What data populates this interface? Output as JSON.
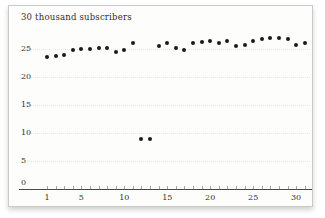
{
  "chart_data": {
    "type": "scatter",
    "title": "30 thousand subscribers",
    "xlabel": "",
    "ylabel": "thousand subscribers",
    "xlim": [
      0,
      32
    ],
    "ylim": [
      0,
      30
    ],
    "grid": "faint dotted horizontal lines",
    "legend": "none",
    "yticks": [
      25,
      20,
      15,
      10,
      5,
      0
    ],
    "ytick_labels": [
      "25",
      "20",
      "15",
      "10",
      "5",
      "0"
    ],
    "xtick_every_unit": true,
    "xticks_labeled": [
      1,
      5,
      10,
      15,
      20,
      25,
      30
    ],
    "xtick_labels": [
      "1",
      "5",
      "10",
      "15",
      "20",
      "25",
      "30"
    ],
    "x": [
      1,
      2,
      3,
      4,
      5,
      6,
      7,
      8,
      9,
      10,
      11,
      12,
      13,
      14,
      15,
      16,
      17,
      18,
      19,
      20,
      21,
      22,
      23,
      24,
      25,
      26,
      27,
      28,
      29,
      30,
      31
    ],
    "values": [
      23.5,
      23.75,
      24,
      24.75,
      25,
      25,
      25.25,
      25.25,
      24.5,
      24.75,
      26,
      9,
      9,
      25.5,
      26,
      25.25,
      24.75,
      26,
      26.25,
      26.5,
      26,
      26.5,
      25.5,
      25.75,
      26.5,
      26.75,
      27,
      27,
      26.75,
      25.75,
      26
    ],
    "annotations": [
      "two outlier points at x=12 and x=13 near value 9"
    ]
  },
  "colors": {
    "dot": "#1a1a1a",
    "axis": "#4a4a4a",
    "tick": "#a8a49e",
    "label": "#2f2f2f",
    "grid": "#e9e7e2",
    "card_border": "#c9c9c9",
    "card_bg": "#fdfdfb",
    "page_bg": "#ffffff"
  }
}
